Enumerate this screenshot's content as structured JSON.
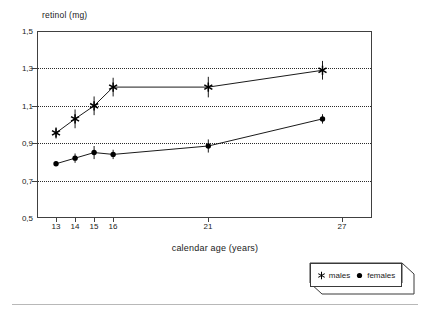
{
  "chart_data": {
    "type": "line",
    "title": "",
    "xlabel": "calendar age (years)",
    "ylabel": "retinol (mg)",
    "x": [
      13,
      14,
      15,
      16,
      21,
      27
    ],
    "xtick_labels": [
      "13",
      "14",
      "15",
      "16",
      "21",
      "27"
    ],
    "ytick_labels": [
      "1,5",
      "1,3",
      "1,1",
      "0,9",
      "0,7",
      "0,5"
    ],
    "ytick_values": [
      1.5,
      1.3,
      1.1,
      0.9,
      0.7,
      0.5
    ],
    "xlim": [
      12.0,
      29.6
    ],
    "ylim": [
      0.5,
      1.5
    ],
    "grid": "horizontal-dotted",
    "gridline_values": [
      1.3,
      1.1,
      0.9,
      0.7
    ],
    "legend_position": "below-right-outside",
    "series": [
      {
        "name": "males",
        "marker": "asterisk-star",
        "values": [
          0.955,
          1.03,
          1.1,
          1.2,
          1.2,
          1.29
        ],
        "errors": [
          0.03,
          0.05,
          0.05,
          0.05,
          0.055,
          0.05
        ]
      },
      {
        "name": "females",
        "marker": "filled-circle",
        "values": [
          0.79,
          0.82,
          0.85,
          0.84,
          0.885,
          1.03
        ],
        "errors": [
          0.012,
          0.025,
          0.035,
          0.025,
          0.035,
          0.025
        ]
      }
    ]
  },
  "legend": {
    "items": [
      {
        "label": "males",
        "marker": "asterisk-star"
      },
      {
        "label": "females",
        "marker": "filled-circle"
      }
    ]
  }
}
